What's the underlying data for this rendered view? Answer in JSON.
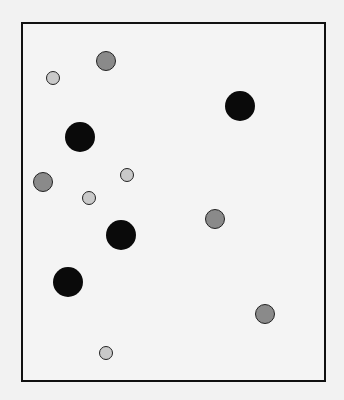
{
  "frame": {
    "x": 21,
    "y": 22,
    "width": 305,
    "height": 360
  },
  "colors": {
    "large": "#0a0a0a",
    "medium": "#8a8a8a",
    "small": "#c9c9c9"
  },
  "circles": [
    {
      "size": "medium",
      "cx": 106,
      "cy": 61,
      "r": 10
    },
    {
      "size": "small",
      "cx": 53,
      "cy": 78,
      "r": 7
    },
    {
      "size": "large",
      "cx": 240,
      "cy": 106,
      "r": 15
    },
    {
      "size": "large",
      "cx": 80,
      "cy": 137,
      "r": 15
    },
    {
      "size": "small",
      "cx": 127,
      "cy": 175,
      "r": 7
    },
    {
      "size": "medium",
      "cx": 43,
      "cy": 182,
      "r": 10
    },
    {
      "size": "small",
      "cx": 89,
      "cy": 198,
      "r": 7
    },
    {
      "size": "medium",
      "cx": 215,
      "cy": 219,
      "r": 10
    },
    {
      "size": "large",
      "cx": 121,
      "cy": 235,
      "r": 15
    },
    {
      "size": "large",
      "cx": 68,
      "cy": 282,
      "r": 15
    },
    {
      "size": "medium",
      "cx": 265,
      "cy": 314,
      "r": 10
    },
    {
      "size": "small",
      "cx": 106,
      "cy": 353,
      "r": 7
    }
  ]
}
